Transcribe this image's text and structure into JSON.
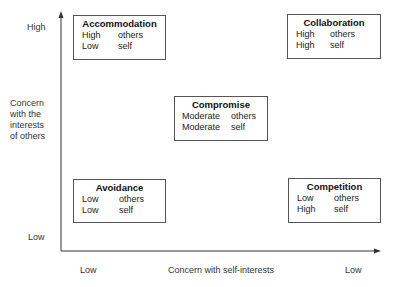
{
  "y_axis": {
    "title_lines": [
      "Concern",
      "with the",
      "interests",
      "of others"
    ],
    "high_label": "High",
    "low_label": "Low"
  },
  "x_axis": {
    "title": "Concern with self-interests",
    "left_label": "Low",
    "right_label": "Low"
  },
  "boxes": [
    {
      "title": "Accommodation",
      "rows": [
        {
          "level": "High",
          "target": "others"
        },
        {
          "level": "Low",
          "target": "self"
        }
      ]
    },
    {
      "title": "Collaboration",
      "rows": [
        {
          "level": "High",
          "target": "others"
        },
        {
          "level": "High",
          "target": "self"
        }
      ]
    },
    {
      "title": "Compromise",
      "rows": [
        {
          "level": "Moderate",
          "target": "others"
        },
        {
          "level": "Moderate",
          "target": "self"
        }
      ]
    },
    {
      "title": "Avoidance",
      "rows": [
        {
          "level": "Low",
          "target": "others"
        },
        {
          "level": "Low",
          "target": "self"
        }
      ]
    },
    {
      "title": "Competition",
      "rows": [
        {
          "level": "Low",
          "target": "others"
        },
        {
          "level": "High",
          "target": "self"
        }
      ]
    }
  ],
  "colors": {
    "line": "#333333",
    "border": "#555555",
    "text": "#222222"
  }
}
